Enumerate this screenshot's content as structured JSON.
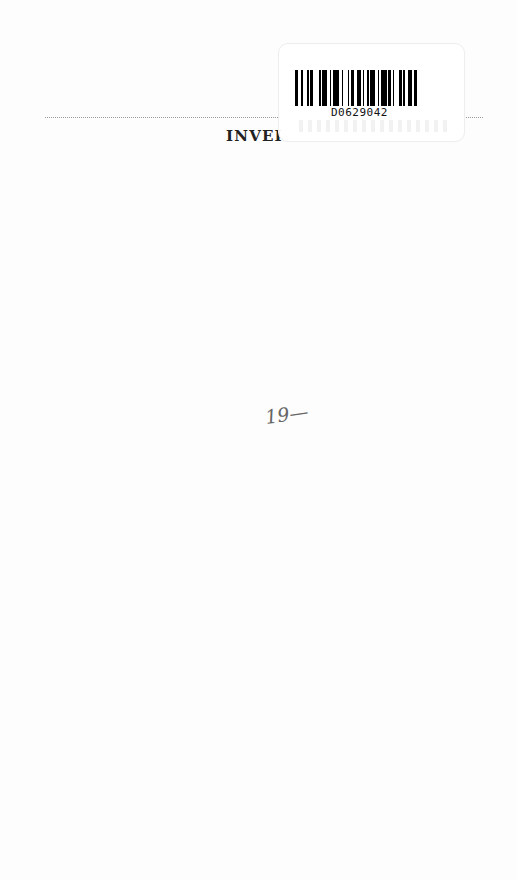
{
  "page": {
    "title_fragment": "INVEI",
    "handwritten_note": "19—"
  },
  "sticker": {
    "barcode_number": "D0629042",
    "bar_pattern": [
      2,
      2,
      1,
      3,
      1,
      1,
      2,
      4,
      1,
      1,
      3,
      2,
      1,
      1,
      4,
      2,
      1,
      3,
      1,
      1,
      2,
      2,
      3,
      1,
      1,
      2,
      1,
      1,
      3,
      2,
      1,
      1,
      4,
      1,
      2,
      1,
      1,
      3,
      2,
      1,
      1,
      2,
      3,
      1,
      2,
      2
    ]
  },
  "colors": {
    "ink": "#000000",
    "rule": "#9a9a9a",
    "paper": "#fdfdfd"
  }
}
